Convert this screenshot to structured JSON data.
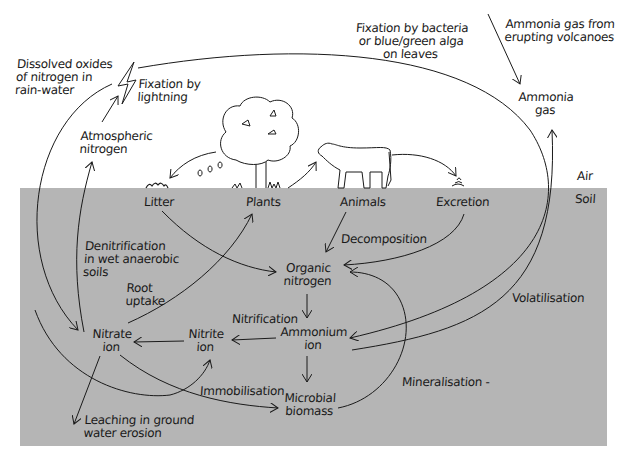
{
  "colors": {
    "soil": "#b5b5b5",
    "ink": "#1a1a1a",
    "air": "#ffffff"
  },
  "zones": {
    "air": "Air",
    "soil": "Soil"
  },
  "labels": {
    "dissolved_oxides": "Dissolved oxides\nof nitrogen in\nrain-water",
    "fixation_lightning": "Fixation by\nlightning",
    "fixation_bacteria": "Fixation by bacteria\nor blue/green alga\non leaves",
    "ammonia_volcanoes": "Ammonia gas from\nerupting volcanoes",
    "ammonia_gas": "Ammonia\ngas",
    "atmospheric_nitrogen": "Atmospheric\nnitrogen",
    "litter": "Litter",
    "plants": "Plants",
    "animals": "Animals",
    "excretion": "Excretion",
    "denitrification": "Denitrification\nin wet anaerobic\nsoils",
    "decomposition": "Decomposition",
    "organic_nitrogen": "Organic\nnitrogen",
    "root_uptake": "Root\nuptake",
    "volatilisation": "Volatilisation",
    "nitrification": "Nitrification",
    "nitrate_ion": "Nitrate\nion",
    "nitrite_ion": "Nitrite\nion",
    "ammonium_ion": "Ammonium\nion",
    "immobilisation": "Immobilisation",
    "mineralisation": "Mineralisation -",
    "microbial_biomass": "Microbial\nbiomass",
    "leaching": "Leaching in ground\nwater erosion"
  },
  "icons": [
    "lightning-icon",
    "tree-icon",
    "cow-icon",
    "litter-pile-icon",
    "excretion-pile-icon",
    "grass-icon"
  ]
}
